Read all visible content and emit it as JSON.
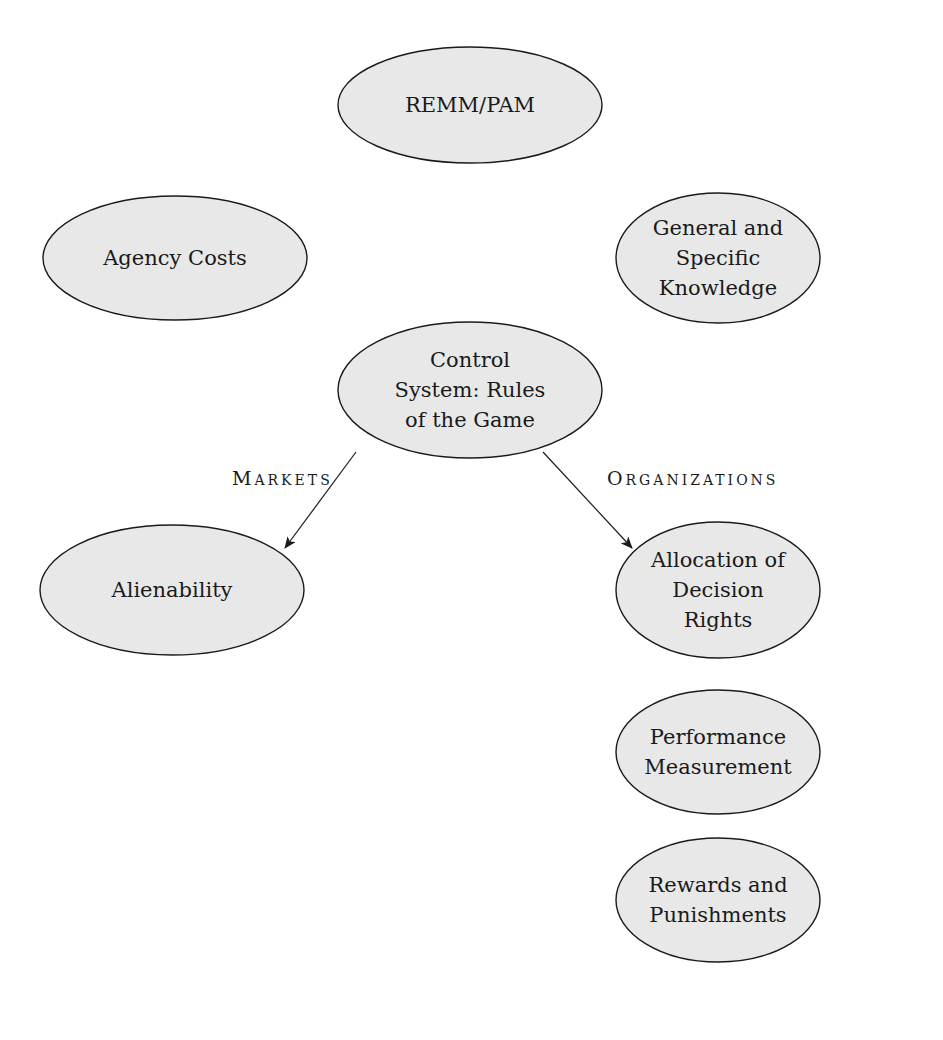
{
  "diagram": {
    "nodes": [
      {
        "id": "remm-pam",
        "lines": [
          "REMM/PAM"
        ],
        "cx": 470,
        "cy": 105,
        "rx": 132,
        "ry": 58
      },
      {
        "id": "agency-costs",
        "lines": [
          "Agency Costs"
        ],
        "cx": 175,
        "cy": 258,
        "rx": 132,
        "ry": 62
      },
      {
        "id": "general-specific-knowledge",
        "lines": [
          "General and",
          "Specific",
          "Knowledge"
        ],
        "cx": 718,
        "cy": 258,
        "rx": 102,
        "ry": 65
      },
      {
        "id": "control-system",
        "lines": [
          "Control",
          "System: Rules",
          "of the Game"
        ],
        "cx": 470,
        "cy": 390,
        "rx": 132,
        "ry": 68
      },
      {
        "id": "alienability",
        "lines": [
          "Alienability"
        ],
        "cx": 172,
        "cy": 590,
        "rx": 132,
        "ry": 65
      },
      {
        "id": "allocation-decision-rights",
        "lines": [
          "Allocation of",
          "Decision",
          "Rights"
        ],
        "cx": 718,
        "cy": 590,
        "rx": 102,
        "ry": 68
      },
      {
        "id": "performance-measurement",
        "lines": [
          "Performance",
          "Measurement"
        ],
        "cx": 718,
        "cy": 752,
        "rx": 102,
        "ry": 62
      },
      {
        "id": "rewards-punishments",
        "lines": [
          "Rewards and",
          "Punishments"
        ],
        "cx": 718,
        "cy": 900,
        "rx": 102,
        "ry": 62
      }
    ],
    "edges": [
      {
        "from": "control-system",
        "to": "alienability",
        "label_first": "M",
        "label_rest": "ARKETS",
        "label_full": "Markets",
        "x1": 356,
        "y1": 452,
        "x2": 285,
        "y2": 548,
        "label_x": 232,
        "label_y": 485
      },
      {
        "from": "control-system",
        "to": "allocation-decision-rights",
        "label_first": "O",
        "label_rest": "RGANIZATIONS",
        "label_full": "Organizations",
        "x1": 543,
        "y1": 452,
        "x2": 632,
        "y2": 548,
        "label_x": 607,
        "label_y": 485
      }
    ],
    "colors": {
      "ellipse_fill": "#e8e8e8",
      "stroke": "#1a1a1a",
      "background": "#ffffff"
    }
  }
}
